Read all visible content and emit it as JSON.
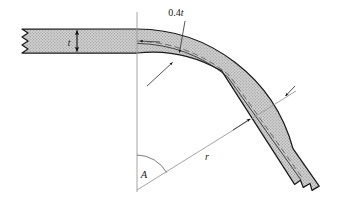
{
  "figure": {
    "background_color": "#ffffff",
    "outline_color": "#1a1a1a",
    "fill_color": "#c9c9c9",
    "stipple_dot_color": "#8f8f8f",
    "centerline_color": "#4a4a4a",
    "construction_line_color": "#9a9a9a"
  },
  "labels": {
    "thickness": {
      "text": "t",
      "name": "thickness-label",
      "x": 69,
      "y": 46
    },
    "offset": {
      "text": "0.4t",
      "prefix": "0.4",
      "symbol": "t",
      "name": "offset-label",
      "x": 176,
      "y": 16
    },
    "radius": {
      "text": "r",
      "name": "radius-label",
      "x": 207,
      "y": 160
    },
    "angle": {
      "text": "A",
      "name": "angle-label",
      "x": 144,
      "y": 178
    }
  },
  "geometry": {
    "arc_center": {
      "x": 137,
      "y": 190
    },
    "bend_angle_degrees": 52,
    "outer_radius": 162,
    "inner_radius": 138,
    "strip_thickness": 24,
    "neutral_axis_offset_fraction": 0.4,
    "straight_arm_top_y": 29,
    "straight_arm_bottom_y": 53,
    "straight_arm_left_x": 22
  },
  "annotations": [
    {
      "name": "thickness-dimension",
      "kind": "double-arrow",
      "label_ref": "thickness"
    },
    {
      "name": "offset-leader",
      "kind": "leader-arrow",
      "label_ref": "offset"
    },
    {
      "name": "radius-leader",
      "kind": "leader-arrow",
      "label_ref": "radius"
    },
    {
      "name": "angle-arc",
      "kind": "arc",
      "label_ref": "angle"
    }
  ]
}
